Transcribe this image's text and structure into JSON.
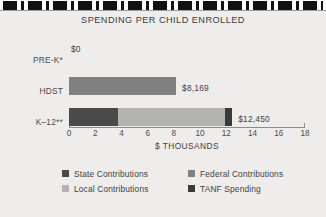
{
  "chart_data": {
    "type": "bar",
    "orientation": "horizontal",
    "stacked": true,
    "title": "SPENDING PER CHILD ENROLLED",
    "xlabel": "$ THOUSANDS",
    "ylabel": "",
    "categories": [
      "PRE-K*",
      "HDST",
      "K–12**"
    ],
    "xlim": [
      0,
      18
    ],
    "xticks": [
      0,
      2,
      4,
      6,
      8,
      10,
      12,
      14,
      16,
      18
    ],
    "xtick_labels": [
      "0",
      "2",
      "4",
      "6",
      "8",
      "10",
      "12",
      "14",
      "16",
      "18"
    ],
    "grid": false,
    "legend_position": "bottom",
    "value_labels": [
      "$0",
      "$8,169",
      "$12,450"
    ],
    "totals": [
      0,
      8.169,
      12.45
    ],
    "series": [
      {
        "name": "State Contributions",
        "color": "#4a4a4a",
        "values": [
          0,
          0,
          3.7
        ]
      },
      {
        "name": "Local Contributions",
        "color": "#b3b3b1",
        "values": [
          0,
          0,
          8.2
        ]
      },
      {
        "name": "Federal Contributions",
        "color": "#808080",
        "values": [
          0,
          8.169,
          0
        ]
      },
      {
        "name": "TANF Spending",
        "color": "#3a3a3a",
        "values": [
          0,
          0,
          0.55
        ]
      }
    ],
    "bars": [
      {
        "category": "PRE-K*",
        "label": "$0",
        "total": 0,
        "segments": []
      },
      {
        "category": "HDST",
        "label": "$8,169",
        "total": 8.169,
        "segments": [
          {
            "series": "Federal Contributions",
            "value": 8.169,
            "color": "#808080"
          }
        ]
      },
      {
        "category": "K–12**",
        "label": "$12,450",
        "total": 12.45,
        "segments": [
          {
            "series": "State Contributions",
            "value": 3.7,
            "color": "#4a4a4a"
          },
          {
            "series": "Local Contributions",
            "value": 8.2,
            "color": "#b3b3b1"
          },
          {
            "series": "TANF Spending",
            "value": 0.55,
            "color": "#3a3a3a"
          }
        ]
      }
    ],
    "legend": [
      {
        "label": "State Contributions",
        "color": "#4a4a4a"
      },
      {
        "label": "Federal Contributions",
        "color": "#808080"
      },
      {
        "label": "Local Contributions",
        "color": "#b3b3b1"
      },
      {
        "label": "TANF Spending",
        "color": "#3a3a3a"
      }
    ]
  },
  "colors": {
    "background": "#eeedeb",
    "axis": "#8d8d8b",
    "text": "#3f3f3f",
    "rule": "#111111"
  }
}
